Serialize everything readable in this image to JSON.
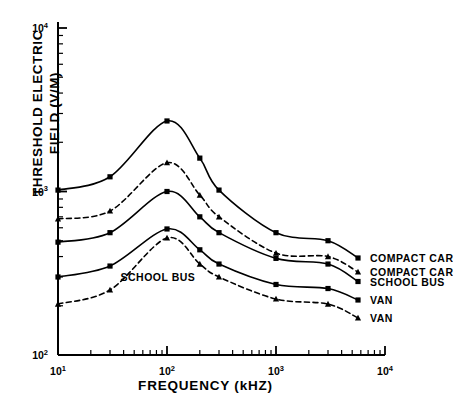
{
  "chart_data": {
    "type": "line",
    "title": "",
    "xlabel": "FREQUENCY  (kHZ)",
    "ylabel": "THRESHOLD  ELECTRIC\nFIELD  (V/M)",
    "xscale": "log",
    "yscale": "log",
    "xlim": [
      10,
      10000
    ],
    "ylim": [
      100,
      10000
    ],
    "xticks": [
      "10¹",
      "10²",
      "10³",
      "10⁴"
    ],
    "xtick_values": [
      10,
      100,
      1000,
      10000
    ],
    "yticks": [
      "10²",
      "10³",
      "10⁴"
    ],
    "ytick_values": [
      100,
      1000,
      10000
    ],
    "grid": false,
    "legend_position": "right-inline",
    "series": [
      {
        "name": "COMPACT CAR",
        "style": "solid",
        "marker": "square",
        "x": [
          10,
          30,
          100,
          200,
          300,
          1000,
          3000
        ],
        "y": [
          1020,
          1230,
          2700,
          1600,
          1020,
          560,
          500
        ]
      },
      {
        "name": "COMPACT CAR",
        "style": "dashed",
        "marker": "triangle",
        "x": [
          10,
          30,
          100,
          200,
          300,
          1000,
          3000
        ],
        "y": [
          680,
          760,
          1500,
          950,
          700,
          420,
          400
        ]
      },
      {
        "name": "SCHOOL BUS",
        "style": "solid",
        "marker": "square",
        "x": [
          10,
          30,
          100,
          200,
          300,
          1000,
          3000
        ],
        "y": [
          490,
          560,
          1000,
          700,
          560,
          390,
          360
        ]
      },
      {
        "name": "VAN",
        "style": "solid",
        "marker": "square",
        "x": [
          10,
          30,
          100,
          200,
          300,
          1000,
          3000
        ],
        "y": [
          300,
          350,
          590,
          440,
          360,
          270,
          255
        ]
      },
      {
        "name": "VAN",
        "style": "dashed",
        "marker": "triangle",
        "x": [
          10,
          30,
          100,
          200,
          300,
          1000,
          3000
        ],
        "y": [
          205,
          250,
          520,
          360,
          300,
          220,
          205
        ]
      }
    ],
    "annotations": [
      {
        "text": "SCHOOL  BUS",
        "x": 33,
        "y": 300
      }
    ],
    "legend_entries": [
      {
        "label": "COMPACT  CAR",
        "style": "solid",
        "marker": "square"
      },
      {
        "label": "COMPACT  CAR",
        "style": "dashed",
        "marker": "triangle"
      },
      {
        "label": "SCHOOL  BUS",
        "style": "solid",
        "marker": "square"
      },
      {
        "label": "VAN",
        "style": "solid",
        "marker": "square"
      },
      {
        "label": "VAN",
        "style": "dashed",
        "marker": "triangle"
      }
    ]
  },
  "axis": {
    "y_title": "THRESHOLD  ELECTRIC\nFIELD  (V/M)",
    "x_title": "FREQUENCY  (kHZ)",
    "x_tick_labels": [
      "10",
      "10",
      "10",
      "10"
    ],
    "x_tick_exps": [
      "1",
      "2",
      "3",
      "4"
    ],
    "y_tick_labels": [
      "10",
      "10",
      "10"
    ],
    "y_tick_exps": [
      "4",
      "3",
      "2"
    ]
  },
  "legend": {
    "items": [
      "COMPACT  CAR",
      "COMPACT  CAR",
      "SCHOOL  BUS",
      "VAN",
      "VAN"
    ]
  },
  "annotation": {
    "school_bus": "SCHOOL  BUS"
  },
  "colors": {
    "ink": "#000000",
    "background": "#ffffff"
  }
}
